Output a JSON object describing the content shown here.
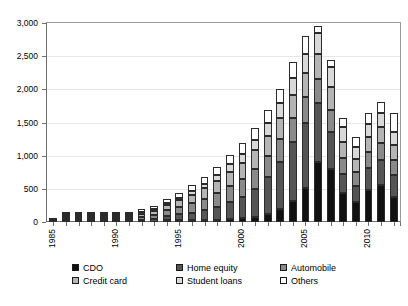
{
  "chart_data": {
    "type": "bar",
    "stacked": true,
    "title": "",
    "subtitle": "",
    "xlabel": "",
    "ylabel": "",
    "grid": true,
    "legend_position": "bottom",
    "ylim": [
      0,
      3000
    ],
    "yticks": [
      0,
      500,
      1000,
      1500,
      2000,
      2500,
      3000
    ],
    "ytick_labels": [
      "0",
      "500",
      "1,000",
      "1,500",
      "2,000",
      "2,500",
      "3,000"
    ],
    "categories": [
      "1985",
      "1986",
      "1987",
      "1988",
      "1989",
      "1990",
      "1991",
      "1992",
      "1993",
      "1994",
      "1995",
      "1996",
      "1997",
      "1998",
      "1999",
      "2000",
      "2001",
      "2002",
      "2003",
      "2004",
      "2005",
      "2006",
      "2007",
      "2008",
      "2009",
      "2010",
      "2011",
      "2012"
    ],
    "xtick_labels": [
      "1985",
      "1990",
      "1995",
      "2000",
      "2005",
      "2010"
    ],
    "xtick_label_indices": [
      0,
      5,
      10,
      15,
      20,
      25
    ],
    "series": [
      {
        "name": "CDO",
        "color": "#111111",
        "values": [
          0,
          0,
          0,
          0,
          0,
          0,
          0,
          0,
          0,
          5,
          8,
          12,
          20,
          28,
          40,
          55,
          80,
          120,
          200,
          320,
          520,
          900,
          800,
          430,
          300,
          480,
          560,
          380
        ]
      },
      {
        "name": "Home equity",
        "color": "#555555",
        "values": [
          0,
          2,
          4,
          6,
          10,
          14,
          18,
          26,
          40,
          60,
          85,
          110,
          150,
          200,
          260,
          320,
          420,
          560,
          700,
          880,
          980,
          900,
          560,
          300,
          250,
          330,
          380,
          330
        ]
      },
      {
        "name": "Automobile",
        "color": "#8a8a8a",
        "values": [
          2,
          5,
          8,
          12,
          18,
          24,
          32,
          48,
          65,
          85,
          110,
          140,
          170,
          200,
          240,
          270,
          300,
          320,
          350,
          370,
          380,
          360,
          330,
          230,
          200,
          240,
          250,
          230
        ]
      },
      {
        "name": "Credit card",
        "color": "#b5b5b5",
        "values": [
          0,
          3,
          6,
          10,
          16,
          22,
          30,
          45,
          60,
          80,
          100,
          130,
          160,
          190,
          220,
          250,
          280,
          300,
          320,
          340,
          360,
          380,
          350,
          250,
          200,
          230,
          240,
          220
        ]
      },
      {
        "name": "Student loans",
        "color": "#d9d9d9",
        "values": [
          0,
          1,
          2,
          3,
          5,
          7,
          10,
          14,
          20,
          30,
          40,
          55,
          70,
          90,
          110,
          130,
          160,
          190,
          220,
          260,
          300,
          310,
          300,
          220,
          180,
          200,
          210,
          200
        ]
      },
      {
        "name": "Others",
        "color": "#ffffff",
        "values": [
          3,
          5,
          8,
          12,
          16,
          20,
          26,
          36,
          50,
          62,
          75,
          90,
          105,
          120,
          140,
          160,
          180,
          200,
          220,
          240,
          260,
          100,
          110,
          140,
          150,
          160,
          170,
          290
        ]
      }
    ]
  },
  "legend": {
    "items": [
      {
        "label": "CDO",
        "swatch": "legend-swatch-cdo"
      },
      {
        "label": "Home equity",
        "swatch": "legend-swatch-home-equity"
      },
      {
        "label": "Automobile",
        "swatch": "legend-swatch-automobile"
      },
      {
        "label": "Credit card",
        "swatch": "legend-swatch-credit-card"
      },
      {
        "label": "Student loans",
        "swatch": "legend-swatch-student-loans"
      },
      {
        "label": "Others",
        "swatch": "legend-swatch-others"
      }
    ]
  }
}
